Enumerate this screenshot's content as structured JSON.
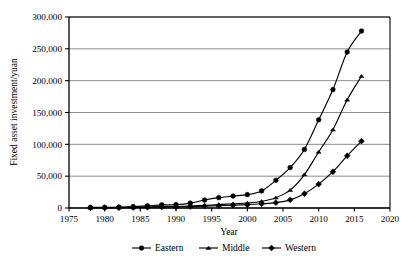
{
  "chart_data": {
    "type": "line",
    "title": "",
    "xlabel": "Year",
    "ylabel": "Fixed asset investment/yuan",
    "xlim": [
      1975,
      2020
    ],
    "ylim": [
      0,
      300000
    ],
    "grid": true,
    "grid_axis": "y",
    "legend_position": "bottom",
    "x_ticks": [
      "1975",
      "1980",
      "1985",
      "1990",
      "1995",
      "2000",
      "2005",
      "2010",
      "2015",
      "2020"
    ],
    "y_ticks": [
      "0",
      "50,000",
      "100,000",
      "150,000",
      "200,000",
      "250,000",
      "300,000"
    ],
    "x": [
      1978,
      1980,
      1982,
      1984,
      1986,
      1988,
      1990,
      1992,
      1994,
      1996,
      1998,
      2000,
      2002,
      2004,
      2006,
      2008,
      2010,
      2012,
      2014,
      2016
    ],
    "series": [
      {
        "name": "Eastern",
        "marker": "circle",
        "values": [
          900,
          1100,
          1400,
          2100,
          3400,
          4800,
          5200,
          7600,
          12500,
          16200,
          18800,
          21000,
          26800,
          43500,
          63500,
          92000,
          138500,
          186000,
          245000,
          278000
        ]
      },
      {
        "name": "Middle",
        "marker": "triangle",
        "values": [
          400,
          500,
          700,
          1000,
          1600,
          2300,
          2400,
          3100,
          4200,
          5400,
          6600,
          7800,
          10500,
          16200,
          28000,
          52500,
          88000,
          123000,
          170000,
          207000
        ]
      },
      {
        "name": "Western",
        "marker": "diamond",
        "values": [
          300,
          400,
          500,
          800,
          1200,
          1700,
          1800,
          2200,
          2900,
          3600,
          4300,
          5200,
          6600,
          8400,
          12800,
          22500,
          37500,
          57000,
          82000,
          105000
        ]
      }
    ]
  },
  "legend": {
    "entries": [
      {
        "label": "Eastern"
      },
      {
        "label": "Middle"
      },
      {
        "label": "Western"
      }
    ]
  },
  "colors": {
    "line": "#000000",
    "grid": "#808080",
    "axis": "#000000",
    "background": "#ffffff"
  }
}
